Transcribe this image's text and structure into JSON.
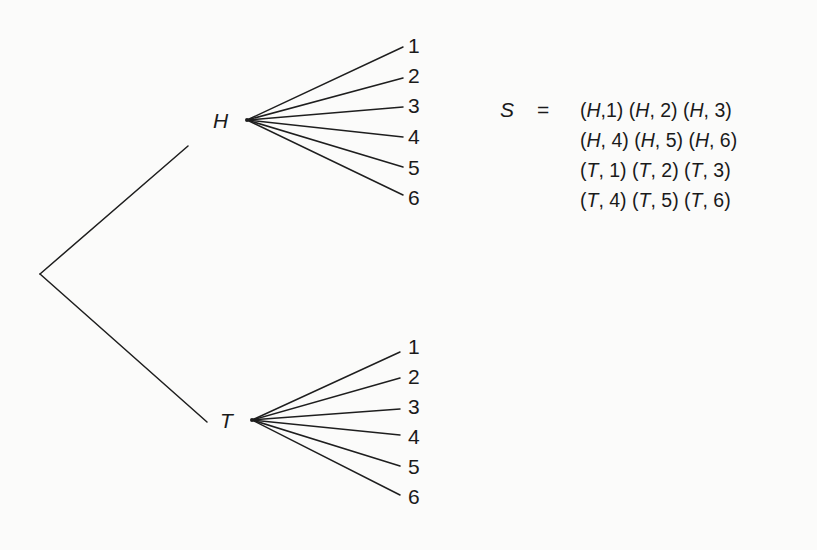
{
  "diagram": {
    "type": "tree-diagram",
    "root": {
      "x": 40,
      "y": 274
    },
    "stages": {
      "first": {
        "nodes": [
          "H",
          "T"
        ]
      },
      "second": {
        "outcomes": [
          "1",
          "2",
          "3",
          "4",
          "5",
          "6"
        ]
      }
    },
    "branches": {
      "H": {
        "label": "H",
        "origin": {
          "x": 247,
          "y": 120
        },
        "outcomes": [
          "1",
          "2",
          "3",
          "4",
          "5",
          "6"
        ]
      },
      "T": {
        "label": "T",
        "origin": {
          "x": 252,
          "y": 420
        },
        "outcomes": [
          "1",
          "2",
          "3",
          "4",
          "5",
          "6"
        ]
      }
    }
  },
  "sample_space": {
    "symbol": "S",
    "equals": "=",
    "rows": [
      [
        [
          "H",
          ",1"
        ],
        [
          "H",
          ", 2"
        ],
        [
          "H",
          ", 3"
        ]
      ],
      [
        [
          "H",
          ", 4"
        ],
        [
          "H",
          ", 5"
        ],
        [
          "H",
          ", 6"
        ]
      ],
      [
        [
          "T",
          ", 1"
        ],
        [
          "T",
          ", 2"
        ],
        [
          "T",
          ", 3"
        ]
      ],
      [
        [
          "T",
          ", 4"
        ],
        [
          "T",
          ", 5"
        ],
        [
          "T",
          ", 6"
        ]
      ]
    ]
  }
}
